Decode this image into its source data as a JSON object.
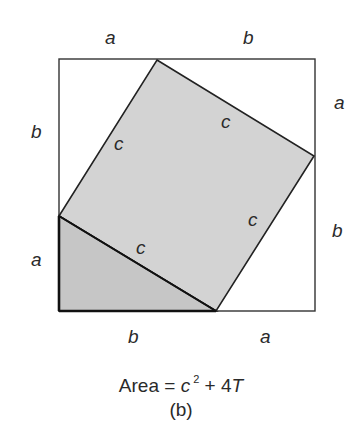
{
  "figure": {
    "side_labels": {
      "top_left": "a",
      "top_right": "b",
      "right_top": "a",
      "right_bottom": "b",
      "left_top": "b",
      "left_bottom": "a",
      "bottom_left": "b",
      "bottom_right": "a"
    },
    "hypotenuse_labels": [
      "c",
      "c",
      "c",
      "c"
    ],
    "caption": {
      "prefix": "Area = ",
      "var_c": "c",
      "exponent": "2",
      "middle": " + 4",
      "var_t": "T",
      "sublabel": "(b)"
    },
    "colors": {
      "inner_square_fill": "#d3d3d3",
      "triangle_fill": "#c8c8c8",
      "stroke": "#222222"
    }
  }
}
